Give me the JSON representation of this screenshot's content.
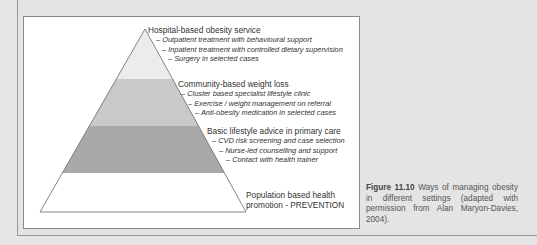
{
  "figure": {
    "pyramid": {
      "tiers": [
        {
          "heading": "Hospital-based obesity service",
          "items": [
            "– Outpatient treatment with behavioural support",
            "– Inpatient treatment with controlled dietary supervision",
            "– Surgery in selected cases"
          ],
          "fill": "#ececec"
        },
        {
          "heading": "Community-based weight loss",
          "items": [
            "– Cluster based specialist lifestyle clinic",
            "– Exercise / weight management on referral",
            "– Anti-obesity medication in selected cases"
          ],
          "fill": "#c9c9c9"
        },
        {
          "heading": "Basic lifestyle advice in primary care",
          "items": [
            "– CVD risk screening and case selection",
            "– Nurse-led counselling and support",
            "– Contact with health trainer"
          ],
          "fill": "#a9a9a9"
        },
        {
          "heading_lines": [
            "Population based health",
            "promotion - PREVENTION"
          ],
          "fill": "#ffffff"
        }
      ]
    },
    "caption": {
      "label": "Figure 11.10",
      "text": " Ways of managing obesity in different settings (adapted with permission from Alan Maryon-Davies, 2004)."
    }
  }
}
